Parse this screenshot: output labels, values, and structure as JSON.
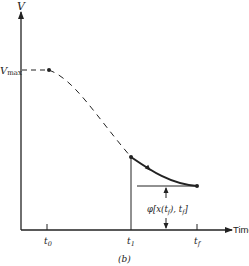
{
  "figure": {
    "caption": "(b)",
    "y_axis_label": "V",
    "x_axis_label": "Time",
    "vmax_label": "V",
    "vmax_subscript": "max",
    "ticks": [
      {
        "label": "t",
        "sub": "0"
      },
      {
        "label": "t",
        "sub": "1"
      },
      {
        "label": "t",
        "sub": "f"
      }
    ],
    "terminal_cost_label": "φ[x(t",
    "terminal_cost_label_mid": "f",
    "terminal_cost_label_tail": "), t",
    "terminal_cost_label_end": "f",
    "terminal_cost_close": "]"
  },
  "colors": {
    "ink": "#222222",
    "background": "#ffffff"
  }
}
